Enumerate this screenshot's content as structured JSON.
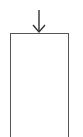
{
  "diagram": {
    "arrow": {
      "direction": "down",
      "icon": "arrow-down-icon",
      "color": "#333333"
    },
    "box": {
      "label": "",
      "border_color": "#555555"
    }
  }
}
